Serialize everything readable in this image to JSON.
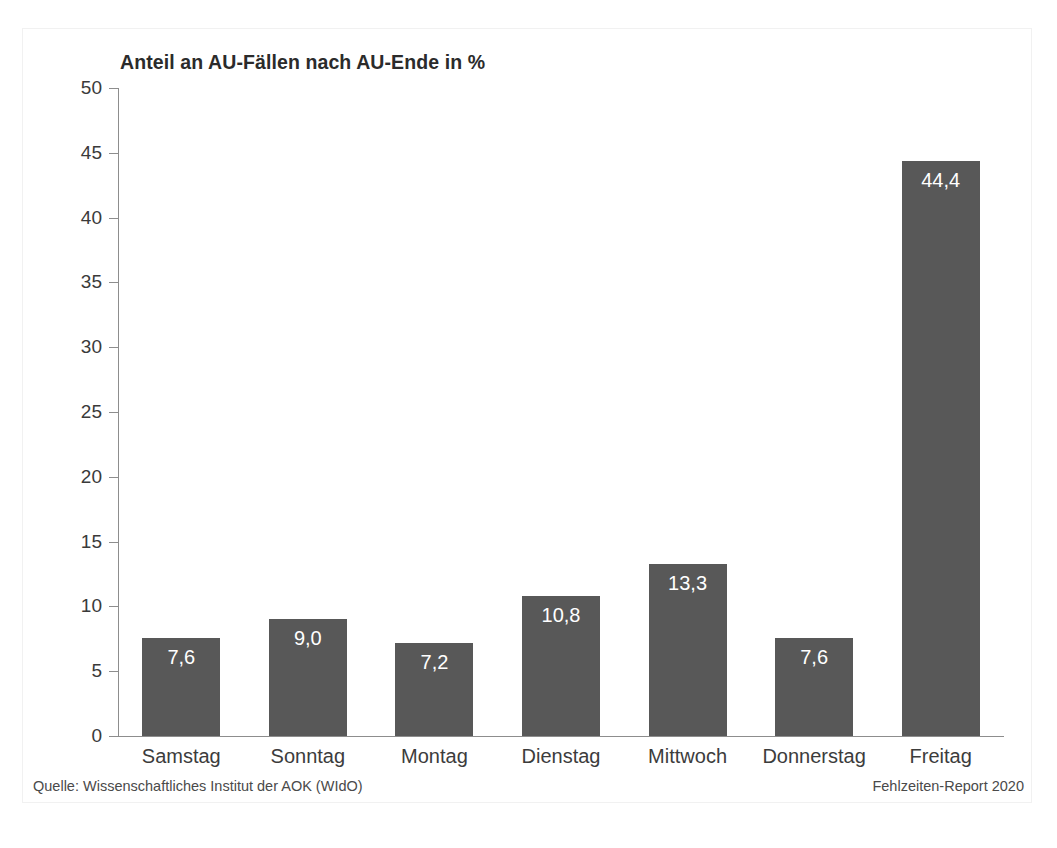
{
  "chart_data": {
    "type": "bar",
    "title": "Anteil an AU-Fällen nach AU-Ende in %",
    "xlabel": "",
    "ylabel": "",
    "ylim": [
      0,
      50
    ],
    "yticks": [
      0,
      5,
      10,
      15,
      20,
      25,
      30,
      35,
      40,
      45,
      50
    ],
    "ytick_labels": [
      "0",
      "5",
      "10",
      "15",
      "20",
      "25",
      "30",
      "35",
      "40",
      "45",
      "50"
    ],
    "grid": false,
    "legend": null,
    "bar_color": "#585858",
    "value_label_color": "#ffffff",
    "categories": [
      "Samstag",
      "Sonntag",
      "Montag",
      "Dienstag",
      "Mittwoch",
      "Donnerstag",
      "Freitag"
    ],
    "values": [
      7.6,
      9.0,
      7.2,
      10.8,
      13.3,
      7.6,
      44.4
    ],
    "value_labels": [
      "7,6",
      "9,0",
      "7,2",
      "10,8",
      "13,3",
      "7,6",
      "44,4"
    ]
  },
  "footer": {
    "source": "Quelle: Wissenschaftliches Institut der AOK (WIdO)",
    "report": "Fehlzeiten-Report 2020"
  }
}
